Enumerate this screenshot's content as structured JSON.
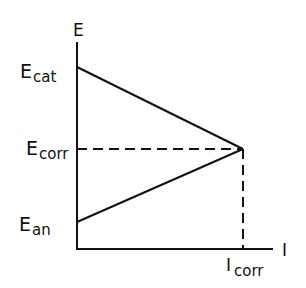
{
  "diagram": {
    "type": "Evans diagram",
    "axes": {
      "y_label": "E",
      "x_label": "I"
    },
    "labels": {
      "e_cat": {
        "main": "E",
        "sub": "cat"
      },
      "e_corr": {
        "main": "E",
        "sub": "corr"
      },
      "e_an": {
        "main": "E",
        "sub": "an"
      },
      "i_corr": {
        "main": "I",
        "sub": "corr"
      }
    },
    "lines": [
      {
        "name": "cathodic",
        "from": "E_cat",
        "to": "intersection",
        "style": "solid"
      },
      {
        "name": "anodic",
        "from": "E_an",
        "to": "intersection",
        "style": "solid"
      },
      {
        "name": "E_corr level",
        "style": "dashed"
      },
      {
        "name": "I_corr drop",
        "style": "dashed"
      }
    ],
    "colors": {
      "ink": "#111111",
      "background": "#ffffff"
    }
  }
}
